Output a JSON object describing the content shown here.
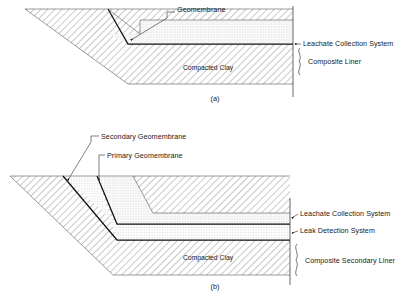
{
  "figure": {
    "type": "engineering-cross-section",
    "colors": {
      "ink": "#1a1a1a",
      "membrane": "#111111",
      "hatch": "#777777",
      "dots": "#999999",
      "background": "#ffffff"
    }
  },
  "panels": [
    {
      "id": "a",
      "caption": "(a)",
      "caption_x": 215,
      "caption_y": 101,
      "internal_labels": [
        {
          "name": "compacted-clay",
          "text": "Compacted Clay",
          "x": 208,
          "y": 70
        }
      ],
      "callouts": [
        {
          "name": "geomembrane",
          "text": "Geomembrane",
          "text_x": 177,
          "text_y": 12,
          "anchor": "start"
        },
        {
          "name": "leachate-collection-system",
          "text": "Leachate Collection System",
          "text_x": 303,
          "text_y": 44,
          "anchor": "start"
        },
        {
          "name": "composite-liner",
          "text": "Composite Liner",
          "text_x": 308,
          "text_y": 70,
          "anchor": "start"
        }
      ]
    },
    {
      "id": "b",
      "caption": "(b)",
      "caption_x": 215,
      "caption_y": 289,
      "internal_labels": [
        {
          "name": "compacted-clay",
          "text": "Compacted Clay",
          "x": 208,
          "y": 260
        }
      ],
      "callouts": [
        {
          "name": "secondary-geomembrane",
          "text": "Secondary Geomembrane",
          "text_x": 101,
          "text_y": 136,
          "anchor": "start"
        },
        {
          "name": "primary-geomembrane",
          "text": "Primary Geomembrane",
          "text_x": 107,
          "text_y": 155,
          "anchor": "start"
        },
        {
          "name": "leachate-collection-system",
          "text": "Leachate Collection System",
          "text_x": 300,
          "text_y": 214,
          "anchor": "start"
        },
        {
          "name": "leak-detection-system",
          "text": "Leak Detection System",
          "text_x": 300,
          "text_y": 231,
          "anchor": "start"
        },
        {
          "name": "composite-secondary-liner",
          "text": "Composite Secondary Liner",
          "text_x": 305,
          "text_y": 261,
          "anchor": "start"
        }
      ]
    }
  ]
}
